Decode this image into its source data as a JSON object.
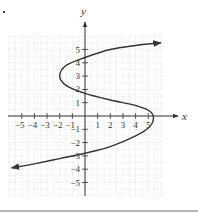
{
  "chart_data": {
    "type": "line",
    "title": "",
    "xlabel": "x",
    "ylabel": "y",
    "xlim": [
      -6,
      6
    ],
    "ylim": [
      -6,
      6
    ],
    "grid": true,
    "x_ticks": [
      -5,
      -4,
      -3,
      -2,
      -1,
      1,
      2,
      3,
      4,
      5
    ],
    "y_ticks": [
      5,
      4,
      3,
      2,
      1,
      -1,
      -2,
      -3,
      -4,
      -5
    ],
    "x_tick_labels": [
      "−5",
      "−4",
      "−3",
      "−2",
      "−1",
      "1",
      "2",
      "3",
      "4",
      "5"
    ],
    "y_tick_labels": [
      "5",
      "4",
      "3",
      "2",
      "1",
      "−1",
      "−2",
      "−3",
      "−4",
      "−5"
    ],
    "series": [
      {
        "name": "curve",
        "description": "S-shaped curve, x as a function of y, arrows at both ends",
        "points": [
          {
            "x": 6.0,
            "y": 5.5
          },
          {
            "x": 4.0,
            "y": 5.3
          },
          {
            "x": 2.0,
            "y": 5.0
          },
          {
            "x": 0.0,
            "y": 4.4
          },
          {
            "x": -1.5,
            "y": 3.8
          },
          {
            "x": -2.0,
            "y": 3.0
          },
          {
            "x": -1.5,
            "y": 2.3
          },
          {
            "x": 0.0,
            "y": 1.7
          },
          {
            "x": 2.0,
            "y": 1.2
          },
          {
            "x": 4.0,
            "y": 0.8
          },
          {
            "x": 5.2,
            "y": 0.3
          },
          {
            "x": 5.4,
            "y": -0.3
          },
          {
            "x": 5.0,
            "y": -0.9
          },
          {
            "x": 4.0,
            "y": -1.5
          },
          {
            "x": 2.0,
            "y": -2.3
          },
          {
            "x": 0.0,
            "y": -2.8
          },
          {
            "x": -2.0,
            "y": -3.2
          },
          {
            "x": -4.0,
            "y": -3.6
          },
          {
            "x": -5.8,
            "y": -3.9
          }
        ]
      }
    ],
    "annotations": []
  },
  "colors": {
    "curve": "#333333",
    "axis": "#333333",
    "grid": "#d6d6d6",
    "rule": "#b5b5b5"
  }
}
